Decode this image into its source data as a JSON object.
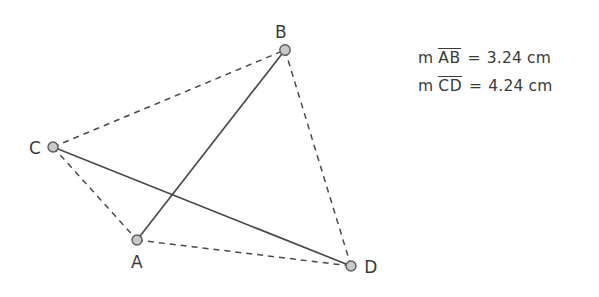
{
  "figure": {
    "type": "geometry-diagram",
    "background_color": "#ffffff",
    "stroke_color": "#4a4a4a",
    "vertex_fill": "#c9c9c9",
    "vertex_stroke": "#5a5a5a",
    "label_color": "#3a3a3a",
    "points": [
      {
        "id": "A",
        "label": "A",
        "x": 137,
        "y": 240,
        "label_x": 137,
        "label_y": 268,
        "label_anchor": "middle"
      },
      {
        "id": "B",
        "label": "B",
        "x": 285,
        "y": 50,
        "label_x": 281,
        "label_y": 38,
        "label_anchor": "middle"
      },
      {
        "id": "C",
        "label": "C",
        "x": 53,
        "y": 147,
        "label_x": 35,
        "label_y": 154,
        "label_anchor": "middle"
      },
      {
        "id": "D",
        "label": "D",
        "x": 351,
        "y": 266,
        "label_x": 371,
        "label_y": 273,
        "label_anchor": "middle"
      }
    ],
    "segments": [
      {
        "id": "AB",
        "from": "A",
        "to": "B",
        "style": "solid"
      },
      {
        "id": "CD",
        "from": "C",
        "to": "D",
        "style": "solid"
      },
      {
        "id": "CB",
        "from": "C",
        "to": "B",
        "style": "dashed"
      },
      {
        "id": "BD",
        "from": "B",
        "to": "D",
        "style": "dashed"
      },
      {
        "id": "CA",
        "from": "C",
        "to": "A",
        "style": "dashed"
      },
      {
        "id": "AD",
        "from": "A",
        "to": "D",
        "style": "dashed"
      }
    ]
  },
  "measurements": {
    "rows": [
      {
        "prefix": "m",
        "segment": "AB",
        "equals": "=",
        "value": "3.24",
        "unit": "cm"
      },
      {
        "prefix": "m",
        "segment": "CD",
        "equals": "=",
        "value": "4.24",
        "unit": "cm"
      }
    ]
  }
}
